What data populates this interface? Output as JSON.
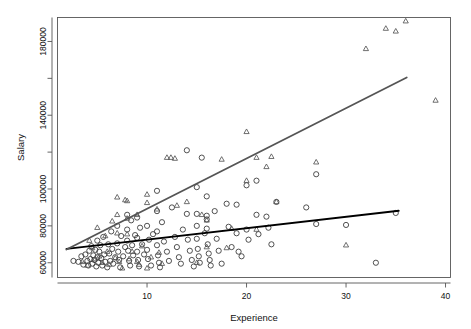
{
  "chart_data": {
    "type": "scatter",
    "title": "",
    "xlabel": "Experience",
    "ylabel": "Salary",
    "xlim": [
      1,
      40.5
    ],
    "ylim": [
      52000,
      193000
    ],
    "grid": false,
    "legend": null,
    "x_ticks": [
      10,
      20,
      30,
      40
    ],
    "x_tick_labels": [
      "10",
      "20",
      "30",
      "40"
    ],
    "y_ticks": [
      60000,
      80000,
      100000,
      120000,
      140000,
      160000,
      180000
    ],
    "y_tick_labels": [
      "60000",
      "80000",
      "100000",
      "",
      "140000",
      "",
      "180000"
    ],
    "colors": {
      "circle_points": "#333333",
      "triangle_points": "#555555",
      "circle_fit_line": "#000000",
      "triangle_fit_line": "#555555",
      "frame": "#555555",
      "background": "#ffffff"
    },
    "series": [
      {
        "name": "circles",
        "marker": "circle",
        "color": "#333333",
        "points": [
          [
            2.6,
            61000
          ],
          [
            3.1,
            60500
          ],
          [
            3.4,
            63500
          ],
          [
            3.6,
            59000
          ],
          [
            3.8,
            64500
          ],
          [
            4.0,
            61000
          ],
          [
            4.1,
            58500
          ],
          [
            4.2,
            66500
          ],
          [
            4.3,
            62000
          ],
          [
            4.4,
            69000
          ],
          [
            4.5,
            59500
          ],
          [
            4.6,
            64000
          ],
          [
            4.7,
            61500
          ],
          [
            4.8,
            67000
          ],
          [
            4.9,
            58000
          ],
          [
            5.0,
            72000
          ],
          [
            5.0,
            63000
          ],
          [
            5.1,
            60000
          ],
          [
            5.2,
            66000
          ],
          [
            5.3,
            69500
          ],
          [
            5.4,
            62500
          ],
          [
            5.5,
            58500
          ],
          [
            5.6,
            74000
          ],
          [
            5.7,
            64500
          ],
          [
            5.8,
            60500
          ],
          [
            6.0,
            57500
          ],
          [
            6.1,
            70000
          ],
          [
            6.2,
            65000
          ],
          [
            6.3,
            61000
          ],
          [
            6.4,
            77000
          ],
          [
            6.5,
            67500
          ],
          [
            6.6,
            59500
          ],
          [
            6.8,
            63000
          ],
          [
            7.0,
            80000
          ],
          [
            7.0,
            70500
          ],
          [
            7.1,
            66000
          ],
          [
            7.2,
            61500
          ],
          [
            7.3,
            57500
          ],
          [
            7.4,
            74500
          ],
          [
            7.6,
            63500
          ],
          [
            7.8,
            68500
          ],
          [
            8.0,
            86000
          ],
          [
            8.0,
            78000
          ],
          [
            8.0,
            72000
          ],
          [
            8.1,
            66500
          ],
          [
            8.2,
            61000
          ],
          [
            8.3,
            58500
          ],
          [
            8.4,
            83000
          ],
          [
            8.5,
            69500
          ],
          [
            8.6,
            64000
          ],
          [
            8.8,
            75000
          ],
          [
            9.0,
            84500
          ],
          [
            9.0,
            73500
          ],
          [
            9.0,
            66000
          ],
          [
            9.1,
            61500
          ],
          [
            9.2,
            58000
          ],
          [
            9.3,
            79000
          ],
          [
            9.5,
            70000
          ],
          [
            9.7,
            64500
          ],
          [
            10.0,
            80000
          ],
          [
            10.0,
            67000
          ],
          [
            10.1,
            62000
          ],
          [
            10.2,
            72500
          ],
          [
            10.4,
            58500
          ],
          [
            10.6,
            75500
          ],
          [
            11.0,
            99000
          ],
          [
            11.0,
            88000
          ],
          [
            11.0,
            77000
          ],
          [
            11.0,
            69500
          ],
          [
            11.1,
            64000
          ],
          [
            11.2,
            60000
          ],
          [
            11.3,
            57500
          ],
          [
            11.5,
            82000
          ],
          [
            11.7,
            71500
          ],
          [
            12.0,
            66000
          ],
          [
            12.2,
            61000
          ],
          [
            12.5,
            90000
          ],
          [
            12.8,
            74000
          ],
          [
            13.0,
            68500
          ],
          [
            13.2,
            63000
          ],
          [
            13.4,
            59500
          ],
          [
            13.6,
            78000
          ],
          [
            14.0,
            121000
          ],
          [
            14.0,
            86500
          ],
          [
            14.1,
            72500
          ],
          [
            14.3,
            66500
          ],
          [
            14.5,
            61500
          ],
          [
            14.7,
            58000
          ],
          [
            15.0,
            101000
          ],
          [
            15.0,
            86500
          ],
          [
            15.0,
            80000
          ],
          [
            15.0,
            73000
          ],
          [
            15.1,
            67500
          ],
          [
            15.2,
            63500
          ],
          [
            15.3,
            60000
          ],
          [
            15.5,
            117000
          ],
          [
            15.8,
            76000
          ],
          [
            16.0,
            96000
          ],
          [
            16.0,
            85500
          ],
          [
            16.0,
            83500
          ],
          [
            16.0,
            78500
          ],
          [
            16.1,
            70000
          ],
          [
            16.2,
            65000
          ],
          [
            16.3,
            61500
          ],
          [
            16.4,
            58500
          ],
          [
            16.8,
            88000
          ],
          [
            17.0,
            73000
          ],
          [
            17.2,
            66500
          ],
          [
            17.5,
            59500
          ],
          [
            18.0,
            92000
          ],
          [
            18.2,
            79500
          ],
          [
            18.5,
            68500
          ],
          [
            19.0,
            91500
          ],
          [
            19.0,
            76000
          ],
          [
            19.2,
            66000
          ],
          [
            19.5,
            63500
          ],
          [
            20.0,
            102000
          ],
          [
            20.0,
            78000
          ],
          [
            20.2,
            72500
          ],
          [
            21.0,
            104500
          ],
          [
            21.0,
            86000
          ],
          [
            21.2,
            75500
          ],
          [
            22.0,
            85000
          ],
          [
            22.2,
            79000
          ],
          [
            22.5,
            70000
          ],
          [
            23.0,
            93000
          ],
          [
            26.0,
            90000
          ],
          [
            27.0,
            108000
          ],
          [
            27.0,
            81000
          ],
          [
            30.0,
            80500
          ],
          [
            33.0,
            60000
          ],
          [
            35.0,
            87000
          ]
        ]
      },
      {
        "name": "triangles",
        "marker": "triangle",
        "color": "#555555",
        "points": [
          [
            3.5,
            60500
          ],
          [
            4.0,
            58500
          ],
          [
            4.2,
            72000
          ],
          [
            4.5,
            68000
          ],
          [
            4.8,
            62000
          ],
          [
            5.0,
            79000
          ],
          [
            5.2,
            63500
          ],
          [
            5.5,
            60000
          ],
          [
            5.8,
            74500
          ],
          [
            6.0,
            66000
          ],
          [
            6.2,
            59000
          ],
          [
            6.5,
            82500
          ],
          [
            6.8,
            62500
          ],
          [
            7.0,
            95500
          ],
          [
            7.0,
            86000
          ],
          [
            7.0,
            76000
          ],
          [
            7.2,
            60500
          ],
          [
            7.5,
            57000
          ],
          [
            7.8,
            94000
          ],
          [
            8.0,
            93500
          ],
          [
            8.0,
            84000
          ],
          [
            8.0,
            75500
          ],
          [
            8.2,
            62000
          ],
          [
            8.5,
            66000
          ],
          [
            9.0,
            86000
          ],
          [
            9.0,
            60500
          ],
          [
            9.2,
            59000
          ],
          [
            9.5,
            69000
          ],
          [
            10.0,
            97000
          ],
          [
            10.0,
            92500
          ],
          [
            10.0,
            57000
          ],
          [
            10.4,
            63000
          ],
          [
            11.0,
            89000
          ],
          [
            11.2,
            65500
          ],
          [
            11.5,
            59500
          ],
          [
            12.0,
            117000
          ],
          [
            12.4,
            117000
          ],
          [
            12.8,
            116500
          ],
          [
            13.0,
            91000
          ],
          [
            14.0,
            93000
          ],
          [
            15.0,
            60000
          ],
          [
            15.5,
            86000
          ],
          [
            16.0,
            83000
          ],
          [
            16.0,
            68500
          ],
          [
            17.5,
            116000
          ],
          [
            18.0,
            68000
          ],
          [
            18.5,
            78500
          ],
          [
            20.0,
            131000
          ],
          [
            20.0,
            104500
          ],
          [
            21.0,
            117000
          ],
          [
            21.0,
            78000
          ],
          [
            22.0,
            112000
          ],
          [
            22.5,
            117500
          ],
          [
            23.0,
            93000
          ],
          [
            27.0,
            114500
          ],
          [
            30.0,
            69500
          ],
          [
            32.0,
            176000
          ],
          [
            34.0,
            187000
          ],
          [
            35.0,
            185500
          ],
          [
            36.0,
            191000
          ],
          [
            39.0,
            148000
          ]
        ]
      }
    ],
    "fit_lines": [
      {
        "name": "circle-fit-line",
        "color": "#000000",
        "width": 1.8,
        "x0": 1.9,
        "y0": 67500,
        "x1": 35.3,
        "y1": 88200
      },
      {
        "name": "triangle-fit-line",
        "color": "#555555",
        "width": 1.8,
        "x0": 1.9,
        "y0": 67200,
        "x1": 36.1,
        "y1": 160500
      }
    ]
  }
}
